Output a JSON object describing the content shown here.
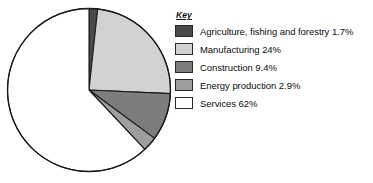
{
  "legend": {
    "title": "Key",
    "entries": [
      {
        "label": "Agriculture, fishing and forestry 1.7%",
        "swatch": "dark-gray-swatch-icon",
        "color": "#4a4a4a"
      },
      {
        "label": "Manufacturing 24%",
        "swatch": "light-gray-swatch-icon",
        "color": "#d2d2d2"
      },
      {
        "label": "Construction 9.4%",
        "swatch": "medium-dark-gray-swatch-icon",
        "color": "#7d7d7d"
      },
      {
        "label": "Energy production 2.9%",
        "swatch": "medium-gray-swatch-icon",
        "color": "#9e9e9e"
      },
      {
        "label": "Services 62%",
        "swatch": "white-swatch-icon",
        "color": "#ffffff"
      }
    ]
  },
  "chart_data": {
    "type": "pie",
    "title": "",
    "xlabel": "",
    "ylabel": "",
    "legend_position": "right",
    "grid": false,
    "start_angle_deg": 0,
    "direction": "clockwise",
    "categories": [
      "Agriculture, fishing and forestry",
      "Manufacturing",
      "Construction",
      "Energy production",
      "Services"
    ],
    "values": [
      1.7,
      24,
      9.4,
      2.9,
      62
    ],
    "value_labels": [
      "1.7%",
      "24%",
      "9.4%",
      "2.9%",
      "62%"
    ],
    "units": "percent",
    "colors": [
      "#4a4a4a",
      "#d2d2d2",
      "#7d7d7d",
      "#9e9e9e",
      "#ffffff"
    ],
    "slice_outline_color": "#1a1a1a",
    "total": 100
  }
}
